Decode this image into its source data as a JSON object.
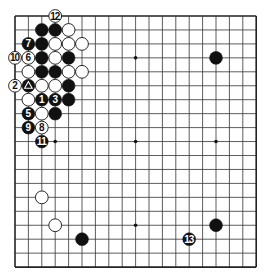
{
  "board": {
    "size": 19,
    "origin_x": 15,
    "origin_y": 16,
    "step_x": 13.4,
    "step_y": 13.95,
    "line_color": "#333333",
    "edge_color": "#222222",
    "black_color": "#111111",
    "white_color": "#ffffff",
    "star_points": [
      [
        3,
        3
      ],
      [
        9,
        3
      ],
      [
        15,
        3
      ],
      [
        3,
        9
      ],
      [
        9,
        9
      ],
      [
        15,
        9
      ],
      [
        3,
        15
      ],
      [
        9,
        15
      ],
      [
        15,
        15
      ]
    ]
  },
  "stones": [
    {
      "color": "white",
      "col": 3,
      "row": 0,
      "label": "12"
    },
    {
      "color": "black",
      "col": 2,
      "row": 1,
      "label": ""
    },
    {
      "color": "black",
      "col": 3,
      "row": 1,
      "label": ""
    },
    {
      "color": "white",
      "col": 4,
      "row": 1,
      "label": ""
    },
    {
      "color": "black",
      "col": 1,
      "row": 2,
      "label": "7"
    },
    {
      "color": "black",
      "col": 2,
      "row": 2,
      "label": ""
    },
    {
      "color": "white",
      "col": 3,
      "row": 2,
      "label": ""
    },
    {
      "color": "white",
      "col": 4,
      "row": 2,
      "label": ""
    },
    {
      "color": "white",
      "col": 5,
      "row": 2,
      "label": ""
    },
    {
      "color": "white",
      "col": 0,
      "row": 3,
      "label": "10"
    },
    {
      "color": "white",
      "col": 1,
      "row": 3,
      "label": "6"
    },
    {
      "color": "black",
      "col": 2,
      "row": 3,
      "label": ""
    },
    {
      "color": "white",
      "col": 3,
      "row": 3,
      "label": ""
    },
    {
      "color": "black",
      "col": 4,
      "row": 3,
      "label": ""
    },
    {
      "color": "white",
      "col": 1,
      "row": 4,
      "label": ""
    },
    {
      "color": "black",
      "col": 2,
      "row": 4,
      "label": ""
    },
    {
      "color": "black",
      "col": 3,
      "row": 4,
      "label": ""
    },
    {
      "color": "white",
      "col": 4,
      "row": 4,
      "label": ""
    },
    {
      "color": "white",
      "col": 5,
      "row": 4,
      "label": ""
    },
    {
      "color": "white",
      "col": 0,
      "row": 5,
      "label": "2"
    },
    {
      "color": "black",
      "col": 1,
      "row": 5,
      "label": "",
      "mark": "triangle"
    },
    {
      "color": "white",
      "col": 2,
      "row": 5,
      "label": ""
    },
    {
      "color": "white",
      "col": 3,
      "row": 5,
      "label": ""
    },
    {
      "color": "black",
      "col": 4,
      "row": 5,
      "label": ""
    },
    {
      "color": "white",
      "col": 1,
      "row": 6,
      "label": ""
    },
    {
      "color": "black",
      "col": 2,
      "row": 6,
      "label": "1"
    },
    {
      "color": "black",
      "col": 3,
      "row": 6,
      "label": "3"
    },
    {
      "color": "black",
      "col": 4,
      "row": 6,
      "label": ""
    },
    {
      "color": "black",
      "col": 1,
      "row": 7,
      "label": "5"
    },
    {
      "color": "white",
      "col": 2,
      "row": 7,
      "label": ""
    },
    {
      "color": "black",
      "col": 3,
      "row": 7,
      "label": ""
    },
    {
      "color": "black",
      "col": 1,
      "row": 8,
      "label": "9"
    },
    {
      "color": "white",
      "col": 2,
      "row": 8,
      "label": "8"
    },
    {
      "color": "black",
      "col": 2,
      "row": 9,
      "label": "11"
    },
    {
      "color": "black",
      "col": 15,
      "row": 3,
      "label": ""
    },
    {
      "color": "white",
      "col": 2,
      "row": 13,
      "label": ""
    },
    {
      "color": "white",
      "col": 3,
      "row": 15,
      "label": ""
    },
    {
      "color": "black",
      "col": 5,
      "row": 16,
      "label": ""
    },
    {
      "color": "black",
      "col": 15,
      "row": 15,
      "label": ""
    },
    {
      "color": "black",
      "col": 13,
      "row": 16,
      "label": "13"
    }
  ]
}
